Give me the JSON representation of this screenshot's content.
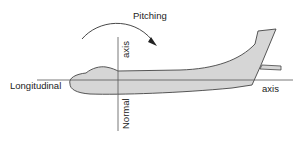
{
  "diagram": {
    "title": "Pitching",
    "labels": {
      "rotation": "Pitching",
      "longitudinal_left": "Longitudinal",
      "longitudinal_right": "axis",
      "normal_top": "axis",
      "normal_bottom": "Normal"
    },
    "colors": {
      "fuselage_fill": "#d6d6d6",
      "outline": "#444444",
      "axis_line": "#555555",
      "text": "#222222"
    }
  }
}
